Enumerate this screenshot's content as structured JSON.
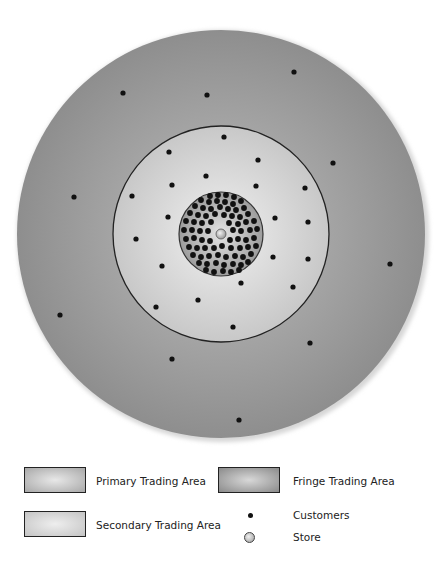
{
  "diagram": {
    "center": [
      221,
      234
    ],
    "fringe": {
      "radius": 204,
      "color_center": "#bdbdbd",
      "color_edge": "#8e8e8e"
    },
    "secondary": {
      "radius": 108,
      "color_center": "#f0f0f0",
      "color_edge": "#c8c8c8"
    },
    "primary": {
      "radius": 42,
      "color_center": "#e6e6e6",
      "color_edge": "#9c9c9c"
    },
    "store": {
      "x": 221,
      "y": 234,
      "r": 5,
      "color": "#b5b5b5"
    },
    "customer_color": "#111111",
    "customer_radius": 2.6,
    "primary_dot_radius": 2.9,
    "fringe_customers": [
      [
        123,
        93
      ],
      [
        207,
        95
      ],
      [
        294,
        72
      ],
      [
        333,
        163
      ],
      [
        74,
        197
      ],
      [
        390,
        264
      ],
      [
        60,
        315
      ],
      [
        172,
        359
      ],
      [
        310,
        343
      ],
      [
        239,
        420
      ]
    ],
    "secondary_customers": [
      [
        224,
        137
      ],
      [
        169,
        152
      ],
      [
        258,
        160
      ],
      [
        206,
        176
      ],
      [
        172,
        185
      ],
      [
        256,
        186
      ],
      [
        132,
        196
      ],
      [
        305,
        188
      ],
      [
        168,
        217
      ],
      [
        275,
        218
      ],
      [
        308,
        222
      ],
      [
        136,
        239
      ],
      [
        273,
        257
      ],
      [
        308,
        259
      ],
      [
        162,
        266
      ],
      [
        241,
        283
      ],
      [
        293,
        287
      ],
      [
        198,
        300
      ],
      [
        156,
        307
      ],
      [
        233,
        327
      ]
    ],
    "primary_customers": [
      [
        210,
        196
      ],
      [
        218,
        195
      ],
      [
        226,
        195
      ],
      [
        234,
        197
      ],
      [
        201,
        200
      ],
      [
        209,
        202
      ],
      [
        217,
        201
      ],
      [
        225,
        202
      ],
      [
        233,
        204
      ],
      [
        241,
        201
      ],
      [
        195,
        206
      ],
      [
        203,
        208
      ],
      [
        211,
        209
      ],
      [
        220,
        207
      ],
      [
        228,
        209
      ],
      [
        236,
        210
      ],
      [
        244,
        208
      ],
      [
        190,
        213
      ],
      [
        198,
        215
      ],
      [
        206,
        216
      ],
      [
        215,
        214
      ],
      [
        224,
        215
      ],
      [
        232,
        216
      ],
      [
        240,
        217
      ],
      [
        248,
        214
      ],
      [
        186,
        221
      ],
      [
        194,
        222
      ],
      [
        202,
        223
      ],
      [
        211,
        222
      ],
      [
        229,
        223
      ],
      [
        238,
        224
      ],
      [
        246,
        222
      ],
      [
        254,
        221
      ],
      [
        184,
        230
      ],
      [
        192,
        230
      ],
      [
        200,
        231
      ],
      [
        208,
        231
      ],
      [
        233,
        230
      ],
      [
        241,
        231
      ],
      [
        250,
        230
      ],
      [
        257,
        229
      ],
      [
        186,
        239
      ],
      [
        194,
        238
      ],
      [
        202,
        240
      ],
      [
        210,
        241
      ],
      [
        230,
        240
      ],
      [
        238,
        239
      ],
      [
        246,
        240
      ],
      [
        254,
        238
      ],
      [
        189,
        247
      ],
      [
        197,
        248
      ],
      [
        205,
        248
      ],
      [
        214,
        248
      ],
      [
        222,
        246
      ],
      [
        231,
        248
      ],
      [
        240,
        248
      ],
      [
        248,
        247
      ],
      [
        256,
        246
      ],
      [
        193,
        255
      ],
      [
        201,
        257
      ],
      [
        209,
        256
      ],
      [
        218,
        255
      ],
      [
        226,
        257
      ],
      [
        235,
        256
      ],
      [
        243,
        257
      ],
      [
        251,
        254
      ],
      [
        199,
        263
      ],
      [
        207,
        264
      ],
      [
        216,
        263
      ],
      [
        224,
        265
      ],
      [
        233,
        264
      ],
      [
        241,
        265
      ],
      [
        248,
        262
      ],
      [
        206,
        270
      ],
      [
        214,
        272
      ],
      [
        223,
        271
      ],
      [
        231,
        272
      ],
      [
        239,
        270
      ]
    ]
  },
  "legend": {
    "primary": {
      "label": "Primary Trading Area",
      "color_center": "#e8e8e8",
      "color_edge": "#a8a8a8"
    },
    "fringe": {
      "label": "Fringe Trading Area",
      "color_center": "#d8d8d8",
      "color_edge": "#8a8a8a"
    },
    "secondary": {
      "label": "Secondary Trading Area",
      "color_center": "#eeeeee",
      "color_edge": "#c4c4c4"
    },
    "customers": {
      "label": "Customers"
    },
    "store": {
      "label": "Store"
    }
  }
}
